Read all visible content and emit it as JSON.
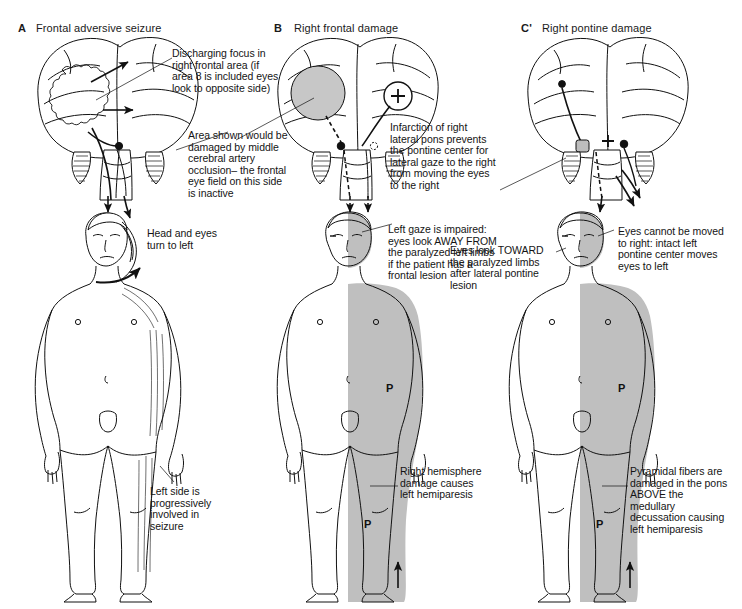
{
  "figure": {
    "type": "medical-illustration",
    "background_color": "#ffffff",
    "ink_color": "#111111",
    "shading_color": "#b9b9b9",
    "lesion_fill": "#c4c4c4"
  },
  "panels": [
    {
      "id": "A",
      "label": "A",
      "title": "Frontal adversive seizure",
      "brain_annotations": [
        {
          "name": "discharging-focus",
          "text": "Discharging focus in right frontal area (if area 8 is included eyes look to opposite side)"
        }
      ],
      "body_annotations": [
        {
          "name": "head-and-eyes-turn",
          "text": "Head and eyes turn to left"
        },
        {
          "name": "left-side-seizure",
          "text": "Left side is progressively involved in seizure"
        }
      ],
      "body_shaded": false,
      "p_marks": []
    },
    {
      "id": "B",
      "label": "B",
      "title": "Right frontal damage",
      "brain_annotations": [
        {
          "name": "mca-occlusion",
          "text": "Area shown would be damaged by middle cerebral artery occlusion– the frontal eye field on this side is inactive"
        }
      ],
      "body_annotations": [
        {
          "name": "left-gaze-impaired",
          "text": "Left gaze is impaired: eyes look AWAY FROM the paralyzed left limbs if the patient has a frontal lesion"
        },
        {
          "name": "right-hemisphere-damage",
          "text": "Right hemisphere damage causes left hemiparesis"
        }
      ],
      "body_shaded": true,
      "p_marks": [
        "P",
        "P"
      ]
    },
    {
      "id": "C",
      "label": "C'",
      "title": "Right pontine damage",
      "brain_annotations": [
        {
          "name": "pontine-infarction",
          "text": "Infarction of right lateral pons prevents the pontine center for lateral gaze to the right from moving the eyes to the right"
        }
      ],
      "body_annotations": [
        {
          "name": "eyes-look-toward",
          "text": "Eyes look TOWARD the paralyzed limbs after lateral pontine lesion"
        },
        {
          "name": "eyes-cannot-move-right",
          "text": "Eyes cannot be moved to right: intact left pontine center moves eyes to left"
        },
        {
          "name": "pyramidal-fibers",
          "text": "Pyramidal fibers are damaged in the pons ABOVE the medullary decussation causing left hemiparesis"
        }
      ],
      "body_shaded": true,
      "p_marks": [
        "P",
        "P"
      ]
    }
  ],
  "symbols": {
    "plus_sign": "+",
    "pyramidal_marker": "P"
  }
}
